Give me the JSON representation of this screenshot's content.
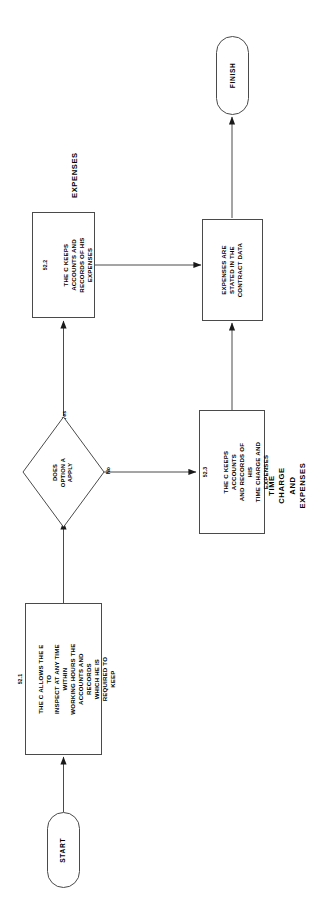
{
  "diagram": {
    "orientation": "rotated-90-ccw",
    "stroke_color": "#4a4a4a",
    "background": "#ffffff"
  },
  "nodes": {
    "start": {
      "label": "START",
      "shape": "terminator"
    },
    "finish": {
      "label": "FINISH",
      "shape": "terminator"
    },
    "step_52_1": {
      "ref": "52.1",
      "text": "THE C ALLOWS THE E TO\nINSPECT AT ANY TIME WITHIN\nWORKING HOURS THE\nACCOUNTS AND RECORDS\nWHICH HE IS REQUIRED TO\nKEEP",
      "shape": "process"
    },
    "decision": {
      "text": "DOES\nOPTION A\nAPPLY",
      "shape": "decision"
    },
    "step_52_2": {
      "ref": "52.2",
      "text": "THE C KEEPS\nACCOUNTS AND\nRECORDS OF HIS\nEXPENSES",
      "shape": "process"
    },
    "step_52_3": {
      "ref": "52.3",
      "text": "THE C KEEPS ACCOUNTS\nAND RECORDS OF HIS\nTIME CHARGE AND\nEXPENSES",
      "shape": "process"
    },
    "contract_data": {
      "text": "EXPENSES ARE\nSTATED IN THE\nCONTRACT DATA",
      "shape": "process"
    }
  },
  "edge_labels": {
    "yes": "Yes",
    "no": "No"
  },
  "annotations": {
    "expenses": "EXPENSES",
    "time_charge_and_expenses": "TIME CHARGE\nAND EXPENSES"
  }
}
